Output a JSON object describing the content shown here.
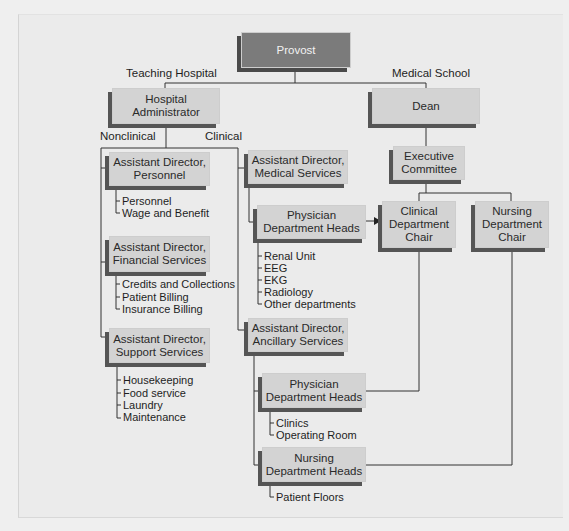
{
  "chart": {
    "provost": "Provost",
    "branches": {
      "teaching_hospital": "Teaching Hospital",
      "medical_school": "Medical School",
      "nonclinical": "Nonclinical",
      "clinical": "Clinical"
    },
    "hospital_administrator": "Hospital\nAdministrator",
    "dean": "Dean",
    "executive_committee": "Executive\nCommittee",
    "clinical_department_chair": "Clinical\nDepartment\nChair",
    "nursing_department_chair": "Nursing\nDepartment\nChair",
    "nonclinical_units": [
      {
        "title": "Assistant Director,\nPersonnel",
        "items": [
          "Personnel",
          "Wage and Benefit"
        ]
      },
      {
        "title": "Assistant Director,\nFinancial Services",
        "items": [
          "Credits and Collections",
          "Patient Billing",
          "Insurance Billing"
        ]
      },
      {
        "title": "Assistant Director,\nSupport Services",
        "items": [
          "Housekeeping",
          "Food service",
          "Laundry",
          "Maintenance"
        ]
      }
    ],
    "medical_services": {
      "title": "Assistant Director,\nMedical Services",
      "physician_heads": {
        "title": "Physician\nDepartment Heads",
        "items": [
          "Renal Unit",
          "EEG",
          "EKG",
          "Radiology",
          "Other departments"
        ]
      }
    },
    "ancillary_services": {
      "title": "Assistant Director,\nAncillary Services",
      "physician_heads": {
        "title": "Physician\nDepartment Heads",
        "items": [
          "Clinics",
          "Operating Room"
        ]
      },
      "nursing_heads": {
        "title": "Nursing\nDepartment Heads",
        "items": [
          "Patient Floors"
        ]
      }
    }
  },
  "colors": {
    "box_fill": "#d3d3d3",
    "box_shadow": "#555555",
    "provost_fill": "#7b7b7b",
    "line": "#333333",
    "background": "#ebebeb"
  }
}
